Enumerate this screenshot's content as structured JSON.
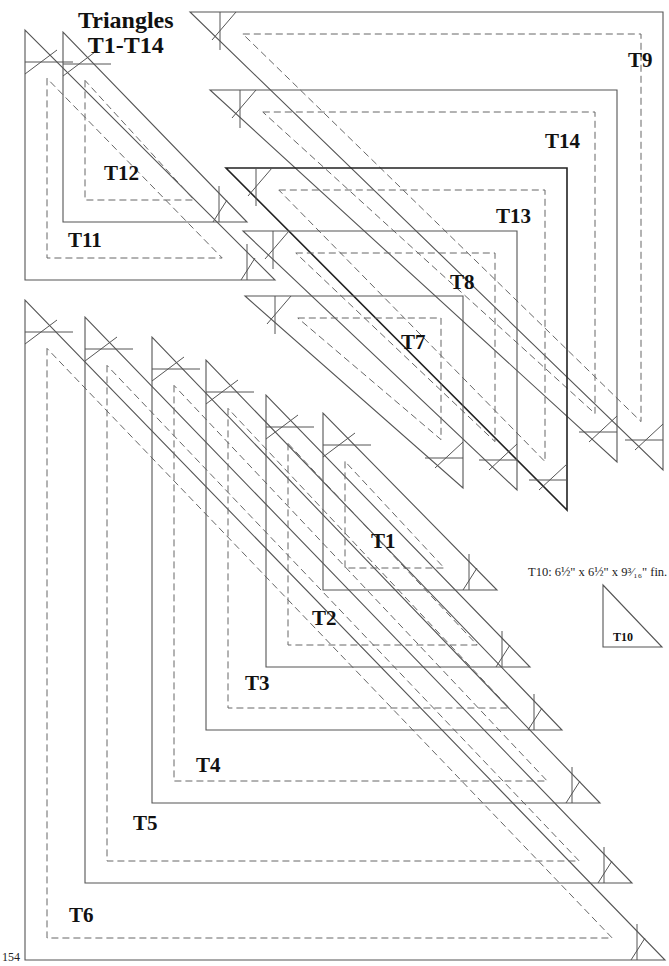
{
  "page": {
    "title_line1": "Triangles",
    "title_line2": "T1-T14",
    "page_number": "154",
    "t10_note": "T10: 6½\" x 6½\" x 9³⁄₁₆\" fin.",
    "t10_label": "T10"
  },
  "labels": {
    "T1": "T1",
    "T2": "T2",
    "T3": "T3",
    "T4": "T4",
    "T5": "T5",
    "T6": "T6",
    "T7": "T7",
    "T8": "T8",
    "T9": "T9",
    "T11": "T11",
    "T12": "T12",
    "T13": "T13",
    "T14": "T14"
  },
  "templates": {
    "bottom_left": [
      {
        "id": "T6",
        "x": 25,
        "y": 960,
        "top": 300,
        "right": 665,
        "inset": 22
      },
      {
        "id": "T5",
        "x": 85,
        "y": 883,
        "top": 317,
        "right": 632,
        "inset": 22
      },
      {
        "id": "T4",
        "x": 152,
        "y": 803,
        "top": 337,
        "right": 600,
        "inset": 22
      },
      {
        "id": "T3",
        "x": 206,
        "y": 730,
        "top": 360,
        "right": 562,
        "inset": 22
      },
      {
        "id": "T2",
        "x": 266,
        "y": 667,
        "top": 395,
        "right": 530,
        "inset": 22
      },
      {
        "id": "T1",
        "x": 323,
        "y": 590,
        "top": 413,
        "right": 497,
        "inset": 22
      },
      {
        "id": "T11",
        "x": 25,
        "y": 280,
        "top": 30,
        "right": 275,
        "inset": 22
      },
      {
        "id": "T12",
        "x": 63,
        "y": 222,
        "top": 32,
        "right": 247,
        "inset": 22
      }
    ],
    "top_right": [
      {
        "id": "T9",
        "x": 663,
        "y": 12,
        "left": 190,
        "bottom": 470,
        "inset": 22,
        "heavy": false
      },
      {
        "id": "T14",
        "x": 617,
        "y": 90,
        "left": 210,
        "bottom": 462,
        "inset": 22,
        "heavy": false
      },
      {
        "id": "T13",
        "x": 567,
        "y": 168,
        "left": 226,
        "bottom": 510,
        "inset": 22,
        "heavy": true
      },
      {
        "id": "T8",
        "x": 517,
        "y": 231,
        "left": 243,
        "bottom": 490,
        "inset": 22,
        "heavy": false
      },
      {
        "id": "T7",
        "x": 463,
        "y": 296,
        "left": 245,
        "bottom": 488,
        "inset": 22,
        "heavy": false
      }
    ],
    "t10": {
      "x": 603,
      "y": 647,
      "top": 585,
      "right": 662
    }
  }
}
